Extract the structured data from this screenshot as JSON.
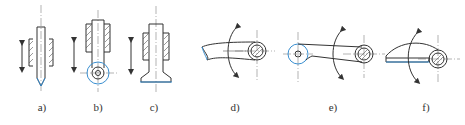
{
  "figure": {
    "colors": {
      "outline": "#333333",
      "contact_highlight": "#3a8fd0",
      "background": "#ffffff"
    },
    "panels": [
      {
        "id": "a",
        "label": "a)",
        "type": "translating knife-edge follower",
        "motion": "reciprocating"
      },
      {
        "id": "b",
        "label": "b)",
        "type": "translating roller follower",
        "motion": "reciprocating"
      },
      {
        "id": "c",
        "label": "c)",
        "type": "translating flat-faced follower",
        "motion": "reciprocating"
      },
      {
        "id": "d",
        "label": "d)",
        "type": "oscillating knife-edge follower",
        "motion": "oscillating"
      },
      {
        "id": "e",
        "label": "e)",
        "type": "oscillating roller follower",
        "motion": "oscillating"
      },
      {
        "id": "f",
        "label": "f)",
        "type": "oscillating flat-faced follower",
        "motion": "oscillating"
      }
    ]
  }
}
